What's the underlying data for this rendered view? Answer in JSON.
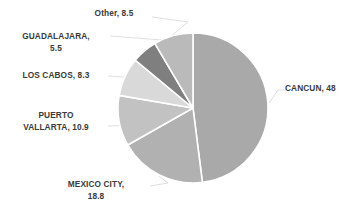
{
  "chart_data": {
    "type": "pie",
    "title": "",
    "categories": [
      "CANCUN",
      "MEXICO CITY",
      "PUERTO VALLARTA",
      "LOS CABOS",
      "GUADALAJARA",
      "Other"
    ],
    "values": [
      48,
      18.8,
      10.9,
      8.3,
      5.5,
      8.5
    ],
    "total": 100,
    "start_angle_deg": 0,
    "direction": "clockwise",
    "legend": "none",
    "grid": false,
    "labels_position": "outside-with-leader-lines",
    "slice_colors": [
      "#a9a9a9",
      "#b1b1b1",
      "#c2c2c2",
      "#d9d9d9",
      "#7f7f7f",
      "#bababa"
    ],
    "slice_border_color": "#ffffff",
    "leader_line_color": "#d7d7d7",
    "label_text_color": "#3a3a3a",
    "slices": [
      {
        "name": "CANCUN",
        "value": 48,
        "label": "CANCUN, 48",
        "color": "#a9a9a9"
      },
      {
        "name": "MEXICO CITY",
        "value": 18.8,
        "label": "MEXICO CITY,\n18.8",
        "color": "#b1b1b1"
      },
      {
        "name": "PUERTO VALLARTA",
        "value": 10.9,
        "label": "PUERTO\nVALLARTA, 10.9",
        "color": "#c2c2c2"
      },
      {
        "name": "LOS CABOS",
        "value": 8.3,
        "label": "LOS CABOS, 8.3",
        "color": "#d9d9d9"
      },
      {
        "name": "GUADALAJARA",
        "value": 5.5,
        "label": "GUADALAJARA,\n5.5",
        "color": "#7f7f7f"
      },
      {
        "name": "Other",
        "value": 8.5,
        "label": "Other, 8.5",
        "color": "#bababa"
      }
    ],
    "geometry": {
      "center_x": 193,
      "center_y": 108,
      "radius": 75
    }
  },
  "labels": {
    "cancun": "CANCUN, 48",
    "mexico_city": "MEXICO CITY,\n18.8",
    "puerto_vallarta": "PUERTO\nVALLARTA, 10.9",
    "los_cabos": "LOS CABOS, 8.3",
    "guadalajara": "GUADALAJARA,\n5.5",
    "other": "Other, 8.5"
  }
}
